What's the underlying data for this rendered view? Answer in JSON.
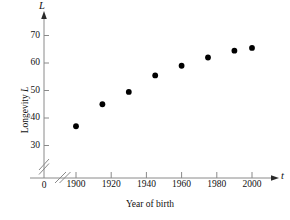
{
  "chart_data": {
    "type": "scatter",
    "title": "",
    "xlabel": "Year of birth",
    "ylabel": "Longevity L",
    "x_axis_variable": "t",
    "y_axis_variable": "L",
    "origin_label": "0",
    "xlim": [
      1900,
      2005
    ],
    "ylim": [
      30,
      72
    ],
    "xticks": [
      1900,
      1920,
      1940,
      1960,
      1980,
      2000
    ],
    "xtick_labels": [
      "1900",
      "1920",
      "1940",
      "1960",
      "1980",
      "2000"
    ],
    "yticks": [
      30,
      40,
      50,
      60,
      70
    ],
    "ytick_labels": [
      "30",
      "40",
      "50",
      "60",
      "70"
    ],
    "grid": false,
    "legend": false,
    "axis_break_x": true,
    "axis_break_y": true,
    "marker": "filled-circle",
    "marker_color": "#000000",
    "axis_color": "#7a7a7a",
    "x": [
      1900,
      1915,
      1930,
      1945,
      1960,
      1975,
      1990,
      2000
    ],
    "y": [
      37,
      45,
      49.5,
      55.5,
      59,
      62,
      64.5,
      65.5
    ],
    "points": [
      {
        "t": 1900,
        "L": 37
      },
      {
        "t": 1915,
        "L": 45
      },
      {
        "t": 1930,
        "L": 49.5
      },
      {
        "t": 1945,
        "L": 55.5
      },
      {
        "t": 1960,
        "L": 59
      },
      {
        "t": 1975,
        "L": 62
      },
      {
        "t": 1990,
        "L": 64.5
      },
      {
        "t": 2000,
        "L": 65.5
      }
    ]
  },
  "labels": {
    "y_title_text": "Longevity ",
    "y_title_var": "L",
    "x_title": "Year of birth",
    "x_var": "t",
    "y_var": "L",
    "origin": "0",
    "ytick_0": "70",
    "ytick_1": "60",
    "ytick_2": "50",
    "ytick_3": "40",
    "ytick_4": "30",
    "xtick_0": "1900",
    "xtick_1": "1920",
    "xtick_2": "1940",
    "xtick_3": "1960",
    "xtick_4": "1980",
    "xtick_5": "2000"
  }
}
